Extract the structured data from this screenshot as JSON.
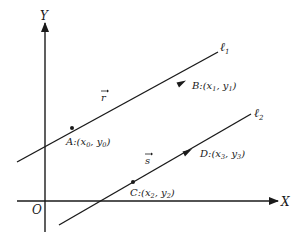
{
  "axes": {
    "x_label": "X",
    "y_label": "Y",
    "origin_label": "O"
  },
  "lines": [
    {
      "name": "ℓ",
      "subscript": "1",
      "points": [
        {
          "label": "A:(x",
          "sub1": "0",
          "mid": ", y",
          "sub2": "0",
          "end": ")"
        },
        {
          "label": "B:(x",
          "sub1": "1",
          "mid": ", y",
          "sub2": "1",
          "end": ")"
        }
      ],
      "vector": "r"
    },
    {
      "name": "ℓ",
      "subscript": "2",
      "points": [
        {
          "label": "C:(x",
          "sub1": "2",
          "mid": ", y",
          "sub2": "2",
          "end": ")"
        },
        {
          "label": "D:(x",
          "sub1": "3",
          "mid": ", y",
          "sub2": "3",
          "end": ")"
        }
      ],
      "vector": "s"
    }
  ],
  "colors": {
    "ink": "#1a1a1a",
    "background": "#ffffff"
  }
}
